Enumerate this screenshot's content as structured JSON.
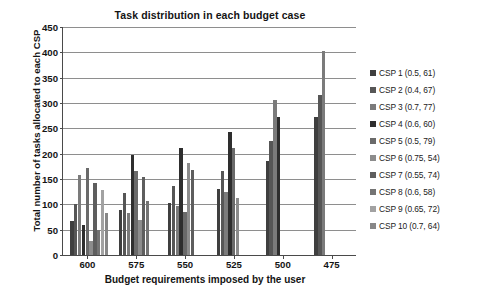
{
  "chart_data": {
    "type": "bar",
    "title": "Task distribution in each budget case",
    "xlabel": "Budget requirements imposed by the user",
    "ylabel": "Total number of tasks allocated to each CSP",
    "categories": [
      "600",
      "575",
      "550",
      "525",
      "500",
      "475"
    ],
    "ylim": [
      0,
      450
    ],
    "yticks": [
      0,
      50,
      100,
      150,
      200,
      250,
      300,
      350,
      400,
      450
    ],
    "grid": "horizontal",
    "legend_position": "right",
    "series": [
      {
        "name": "CSP 1 (0.5, 61)",
        "color": "#3f3f3f",
        "values": [
          68,
          89,
          102,
          130,
          186,
          272
        ]
      },
      {
        "name": "CSP 2 (0.4, 67)",
        "color": "#565656",
        "values": [
          101,
          123,
          137,
          166,
          225,
          315
        ]
      },
      {
        "name": "CSP 3 (0.7, 77)",
        "color": "#7b7b7b",
        "values": [
          158,
          83,
          96,
          124,
          306,
          403
        ]
      },
      {
        "name": "CSP 4 (0.6, 60)",
        "color": "#2e2e2e",
        "values": [
          60,
          198,
          212,
          243,
          272,
          0
        ]
      },
      {
        "name": "CSP 5 (0.5, 79)",
        "color": "#6a6a6a",
        "values": [
          172,
          165,
          85,
          212,
          0,
          0
        ]
      },
      {
        "name": "CSP 6 (0.75, 54)",
        "color": "#8c8c8c",
        "values": [
          28,
          70,
          182,
          113,
          0,
          0
        ]
      },
      {
        "name": "CSP 7 (0.55, 74)",
        "color": "#5e5e5e",
        "values": [
          142,
          154,
          168,
          0,
          0,
          0
        ]
      },
      {
        "name": "CSP 8 (0.6, 58)",
        "color": "#747474",
        "values": [
          50,
          106,
          0,
          0,
          0,
          0
        ]
      },
      {
        "name": "CSP 9 (0.65, 72)",
        "color": "#a2a2a2",
        "values": [
          129,
          0,
          0,
          0,
          0,
          0
        ]
      },
      {
        "name": "CSP 10 (0.7, 64)",
        "color": "#878787",
        "values": [
          83,
          0,
          0,
          0,
          0,
          0
        ]
      }
    ]
  }
}
